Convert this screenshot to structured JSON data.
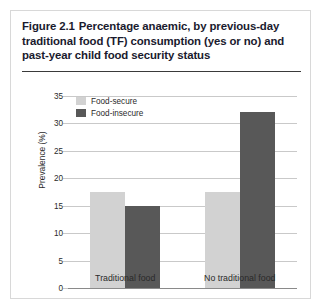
{
  "figure": {
    "number": "Figure 2.1",
    "title_line_1": "Percentage anaemic, by previous-day",
    "title_line_2": "traditional food (TF) consumption (yes or no) and",
    "title_line_3": "past-year child food security status"
  },
  "colors": {
    "food_secure": "#d2d2d2",
    "food_insecure": "#585858",
    "grid": "#c9c9c9",
    "axis": "#8a8a8a",
    "text": "#2a2a2a",
    "title": "#1a1a2e",
    "border": "#d8d8d8"
  },
  "chart_data": {
    "type": "bar",
    "xlabel": "",
    "ylabel": "Prevalence (%)",
    "ylim": [
      0,
      35
    ],
    "yticks": [
      0,
      5,
      10,
      15,
      20,
      25,
      30,
      35
    ],
    "ytick_labels": [
      "0",
      "5",
      "10",
      "15",
      "20",
      "25",
      "30",
      "35"
    ],
    "grid": true,
    "legend_position": "upper-left-inside",
    "categories": [
      "Traditional food",
      "No traditional food"
    ],
    "series": [
      {
        "name": "Food-secure",
        "color": "#d2d2d2",
        "values": [
          17.5,
          17.5
        ]
      },
      {
        "name": "Food-insecure",
        "color": "#585858",
        "values": [
          15.0,
          32.0
        ]
      }
    ]
  }
}
